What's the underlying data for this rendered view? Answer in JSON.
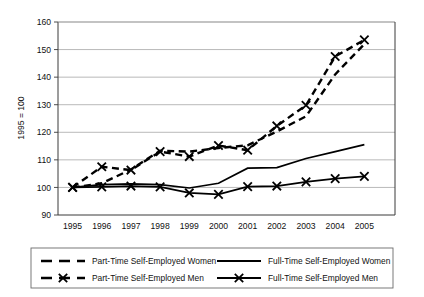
{
  "chart_data": {
    "type": "line",
    "title": "",
    "xlabel": "",
    "ylabel": "1995 = 100",
    "x": [
      1995,
      1996,
      1997,
      1998,
      1999,
      2000,
      2001,
      2002,
      2003,
      2004,
      2005
    ],
    "xtick_labels": [
      "1995",
      "1996",
      "1997",
      "1998",
      "1999",
      "2000",
      "2001",
      "2002",
      "2003",
      "2004",
      "2005"
    ],
    "ytick_labels": [
      "90",
      "100",
      "110",
      "120",
      "130",
      "140",
      "150",
      "160"
    ],
    "ytick_values": [
      90,
      100,
      110,
      120,
      130,
      140,
      150,
      160
    ],
    "ylim": [
      90,
      160
    ],
    "grid": "horizontal",
    "legend_position": "bottom",
    "series": [
      {
        "name": "Part-Time Self-Employed Women",
        "style": "dashed",
        "marker": "none",
        "color": "#000000",
        "values": [
          100.0,
          101.5,
          106.5,
          113.3,
          113.0,
          114.3,
          115.3,
          120.3,
          125.8,
          141.0,
          152.0
        ]
      },
      {
        "name": "Full-Time Self-Employed Women",
        "style": "solid",
        "marker": "none",
        "color": "#000000",
        "values": [
          100.0,
          101.0,
          101.3,
          101.0,
          99.8,
          101.5,
          107.0,
          107.2,
          110.5,
          113.0,
          115.5
        ]
      },
      {
        "name": "Part-Time Self-Employed Men",
        "style": "dashed",
        "marker": "x",
        "color": "#000000",
        "values": [
          100.0,
          107.5,
          106.3,
          113.0,
          111.2,
          115.2,
          113.5,
          122.3,
          129.8,
          147.5,
          153.5
        ]
      },
      {
        "name": "Full-Time Self-Employed Men",
        "style": "solid",
        "marker": "x",
        "color": "#000000",
        "values": [
          100.0,
          100.2,
          100.5,
          100.2,
          98.0,
          97.5,
          100.3,
          100.5,
          102.0,
          103.2,
          104.0
        ]
      }
    ]
  },
  "axis": {
    "y_title": "1995 = 100"
  },
  "legend": {
    "entries": [
      {
        "label": "Part-Time Self-Employed Women",
        "style": "dashed",
        "marker": "none"
      },
      {
        "label": "Full-Time Self-Employed Women",
        "style": "solid",
        "marker": "none"
      },
      {
        "label": "Part-Time Self-Employed Men",
        "style": "dashed",
        "marker": "x"
      },
      {
        "label": "Full-Time Self-Employed Men",
        "style": "solid",
        "marker": "x"
      }
    ]
  },
  "colors": {
    "series": "#000000",
    "grid": "#9a9a9a",
    "frame": "#4a4a4a",
    "background": "#ffffff"
  }
}
